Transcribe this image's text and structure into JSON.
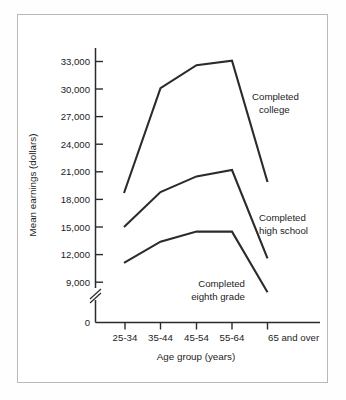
{
  "chart_data": {
    "type": "line",
    "title": "",
    "xlabel": "Age group (years)",
    "ylabel": "Mean earnings (dollars)",
    "categories": [
      "25-34",
      "35-44",
      "45-54",
      "55-64",
      "65 and over"
    ],
    "ytick_labels": [
      "33,000",
      "30,000",
      "27,000",
      "24,000",
      "21,000",
      "18,000",
      "15,000",
      "12,000",
      "9,000",
      "0"
    ],
    "ytick_values": [
      33000,
      30000,
      27000,
      24000,
      21000,
      18000,
      15000,
      12000,
      9000,
      0
    ],
    "ylim": [
      9000,
      33600
    ],
    "y_axis_break": true,
    "y_axis_break_label": "0",
    "grid": false,
    "legend_position": "inline-annotations",
    "line_color": "#2b2b2b",
    "series": [
      {
        "name": "Completed college",
        "label_line_1": "Completed",
        "label_line_2": "college",
        "values": [
          18700,
          30100,
          32600,
          33100,
          19900
        ]
      },
      {
        "name": "Completed high school",
        "label_line_1": "Completed",
        "label_line_2": "high school",
        "values": [
          15000,
          18800,
          20500,
          21200,
          11600
        ]
      },
      {
        "name": "Completed eighth grade",
        "label_line_1": "Completed",
        "label_line_2": "eighth grade",
        "values": [
          11100,
          13400,
          14500,
          14500,
          7900
        ]
      }
    ]
  },
  "axes": {
    "y_title": "Mean earnings (dollars)",
    "x_title": "Age group (years)",
    "zero_label": "0"
  },
  "ytick_0": "33,000",
  "ytick_1": "30,000",
  "ytick_2": "27,000",
  "ytick_3": "24,000",
  "ytick_4": "21,000",
  "ytick_5": "18,000",
  "ytick_6": "15,000",
  "ytick_7": "12,000",
  "ytick_8": "9,000",
  "ytick_zero": "0",
  "xtick_0": "25-34",
  "xtick_1": "35-44",
  "xtick_2": "45-54",
  "xtick_3": "55-64",
  "xtick_4": "65 and over",
  "ann_college_1": "Completed",
  "ann_college_2": "college",
  "ann_highschool_1": "Completed",
  "ann_highschool_2": "high school",
  "ann_eighth_1": "Completed",
  "ann_eighth_2": "eighth grade"
}
